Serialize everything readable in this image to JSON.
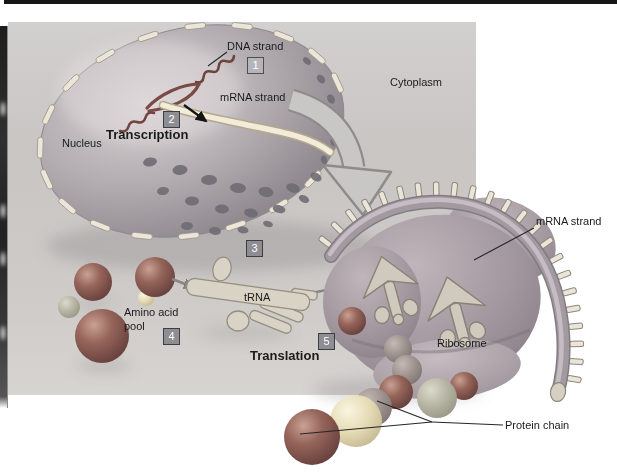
{
  "figure_labels": {
    "dna_strand": "DNA strand",
    "mrna_strand_top": "mRNA strand",
    "transcription": "Transcription",
    "nucleus": "Nucleus",
    "cytoplasm": "Cytoplasm",
    "amino_acid_pool": "Amino acid pool",
    "trna": "tRNA",
    "translation": "Translation",
    "ribosome": "Ribosome",
    "mrna_strand_right": "mRNA strand",
    "protein_chain": "Protein chain"
  },
  "steps": [
    "1",
    "2",
    "3",
    "4",
    "5"
  ],
  "colors": {
    "page_background": "#ffffff",
    "cytoplasm_box": "#cbc8c6",
    "nucleus_base": "#a9a3a8",
    "nuclear_pore": "#6f6a72",
    "envelope_dash": "#ece6d8",
    "dna_strand": "#6f4340",
    "mrna_ribbon": "#f3ecda",
    "ribosome_base": "#9c929a",
    "step_box": "#8f8d94",
    "step_box_light": "#b7b5ba",
    "amino_acid_dark_red": "#8c5a50",
    "amino_acid_cream": "#e4dab4",
    "amino_acid_gray": "#b4b2a1",
    "label_text": "#1b1b1b"
  }
}
